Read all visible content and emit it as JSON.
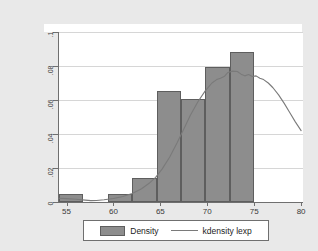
{
  "chart_data": {
    "type": "bar",
    "title": "",
    "subtitle": "",
    "xlabel": "",
    "ylabel": "",
    "xlim": [
      54.2,
      80.2
    ],
    "ylim": [
      0,
      0.1
    ],
    "grid": true,
    "legend_position": "bottom",
    "x_ticks": [
      {
        "value": 55,
        "label": "55"
      },
      {
        "value": 60,
        "label": "60"
      },
      {
        "value": 65,
        "label": "65"
      },
      {
        "value": 70,
        "label": "70"
      },
      {
        "value": 75,
        "label": "75"
      },
      {
        "value": 80,
        "label": "80"
      }
    ],
    "y_ticks": [
      {
        "value": 0,
        "label": "0"
      },
      {
        "value": 0.02,
        "label": ".02"
      },
      {
        "value": 0.04,
        "label": ".04"
      },
      {
        "value": 0.06,
        "label": ".06"
      },
      {
        "value": 0.08,
        "label": ".08"
      },
      {
        "value": 0.1,
        "label": ".1"
      }
    ],
    "series": [
      {
        "name": "Density",
        "kind": "histogram",
        "color": "#8d8d8d",
        "edge_color": "#5e5e5e",
        "bin_width": 2.6,
        "bins": [
          {
            "left": 54.2,
            "right": 56.8,
            "height": 0.0045
          },
          {
            "left": 56.8,
            "right": 59.4,
            "height": 0.0
          },
          {
            "left": 59.4,
            "right": 62.0,
            "height": 0.0045
          },
          {
            "left": 62.0,
            "right": 64.6,
            "height": 0.014
          },
          {
            "left": 64.6,
            "right": 67.2,
            "height": 0.0655
          },
          {
            "left": 67.2,
            "right": 69.8,
            "height": 0.0605
          },
          {
            "left": 69.8,
            "right": 72.4,
            "height": 0.0795
          },
          {
            "left": 72.4,
            "right": 75.0,
            "height": 0.0885
          }
        ]
      },
      {
        "name": "kdensity lexp",
        "kind": "line",
        "color": "#7a7a7a",
        "points": [
          {
            "x": 54.2,
            "y": 0.0022
          },
          {
            "x": 55.0,
            "y": 0.002
          },
          {
            "x": 56.0,
            "y": 0.0016
          },
          {
            "x": 57.0,
            "y": 0.0011
          },
          {
            "x": 57.6,
            "y": 0.0008
          },
          {
            "x": 58.2,
            "y": 0.0009
          },
          {
            "x": 59.0,
            "y": 0.0013
          },
          {
            "x": 60.0,
            "y": 0.0021
          },
          {
            "x": 61.0,
            "y": 0.0032
          },
          {
            "x": 62.0,
            "y": 0.005
          },
          {
            "x": 63.0,
            "y": 0.0078
          },
          {
            "x": 63.8,
            "y": 0.011
          },
          {
            "x": 64.5,
            "y": 0.0145
          },
          {
            "x": 65.2,
            "y": 0.0195
          },
          {
            "x": 66.0,
            "y": 0.0265
          },
          {
            "x": 66.8,
            "y": 0.035
          },
          {
            "x": 67.5,
            "y": 0.043
          },
          {
            "x": 68.2,
            "y": 0.051
          },
          {
            "x": 69.0,
            "y": 0.059
          },
          {
            "x": 69.8,
            "y": 0.0655
          },
          {
            "x": 70.5,
            "y": 0.07
          },
          {
            "x": 71.0,
            "y": 0.072
          },
          {
            "x": 71.4,
            "y": 0.0728
          },
          {
            "x": 71.8,
            "y": 0.0738
          },
          {
            "x": 72.2,
            "y": 0.0762
          },
          {
            "x": 72.7,
            "y": 0.077
          },
          {
            "x": 73.2,
            "y": 0.0768
          },
          {
            "x": 73.6,
            "y": 0.0752
          },
          {
            "x": 74.0,
            "y": 0.0742
          },
          {
            "x": 74.4,
            "y": 0.075
          },
          {
            "x": 74.8,
            "y": 0.0738
          },
          {
            "x": 75.2,
            "y": 0.0742
          },
          {
            "x": 75.6,
            "y": 0.0728
          },
          {
            "x": 76.0,
            "y": 0.072
          },
          {
            "x": 76.5,
            "y": 0.07
          },
          {
            "x": 77.0,
            "y": 0.0672
          },
          {
            "x": 77.6,
            "y": 0.063
          },
          {
            "x": 78.2,
            "y": 0.058
          },
          {
            "x": 78.8,
            "y": 0.0525
          },
          {
            "x": 79.4,
            "y": 0.047
          },
          {
            "x": 80.0,
            "y": 0.042
          }
        ]
      }
    ]
  },
  "legend": {
    "items": [
      {
        "label": "Density",
        "marker": "swatch"
      },
      {
        "label": "kdensity lexp",
        "marker": "line"
      }
    ]
  },
  "colors": {
    "figure_background": "#e9e9e9",
    "plot_background": "#ffffff",
    "bar_fill": "#8d8d8d",
    "bar_edge": "#5e5e5e",
    "density_line": "#7a7a7a",
    "axis": "#6f6f6f",
    "gridline": "#d6d6d6",
    "text": "#1c1c1c"
  }
}
